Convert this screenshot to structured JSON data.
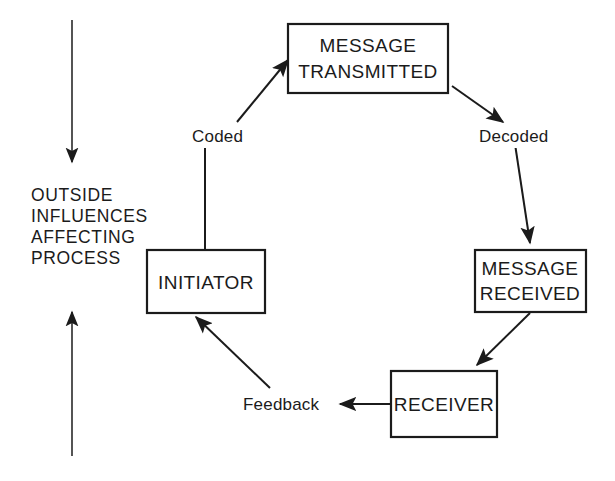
{
  "diagram": {
    "background_color": "#ffffff",
    "line_color": "#1b1b1b",
    "text_color": "#1b1b1b",
    "side_note": {
      "lines": [
        "OUTSIDE",
        "INFLUENCES",
        "AFFECTING",
        "PROCESS"
      ],
      "line1": "OUTSIDE",
      "line2": "INFLUENCES",
      "line3": "AFFECTING",
      "line4": "PROCESS"
    },
    "nodes": [
      {
        "id": "message-transmitted",
        "line1": "MESSAGE",
        "line2": "TRANSMITTED"
      },
      {
        "id": "message-received",
        "line1": "MESSAGE",
        "line2": "RECEIVED"
      },
      {
        "id": "receiver",
        "line1": "RECEIVER",
        "line2": ""
      },
      {
        "id": "initiator",
        "line1": "INITIATOR",
        "line2": ""
      }
    ],
    "edge_labels": {
      "coded": "Coded",
      "decoded": "Decoded",
      "feedback": "Feedback"
    },
    "arrows": {
      "outside_top": "down-arrow",
      "outside_bottom": "up-arrow"
    }
  }
}
